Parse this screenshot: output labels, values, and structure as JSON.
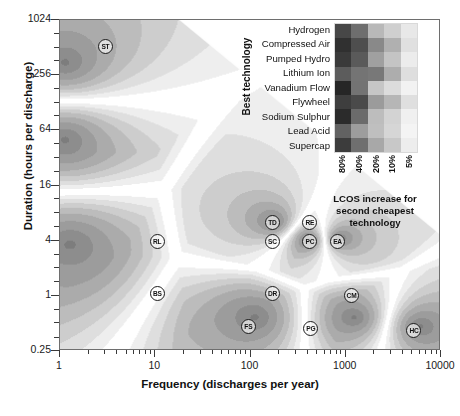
{
  "chart_data": {
    "type": "heatmap",
    "title": "",
    "xlabel": "Frequency (discharges per year)",
    "ylabel": "Duration (hours per discharge)",
    "xscale": "log",
    "yscale": "log",
    "xlim": [
      1,
      10000
    ],
    "ylim": [
      0.25,
      1024
    ],
    "xticks": [
      "1",
      "10",
      "100",
      "1000",
      "10000"
    ],
    "xtick_values": [
      1,
      10,
      100,
      1000,
      10000
    ],
    "yticks": [
      "1024",
      "256",
      "64",
      "16",
      "4",
      "1",
      "0.25"
    ],
    "ytick_values": [
      1024,
      256,
      64,
      16,
      4,
      1,
      0.25
    ],
    "grid": false,
    "legend_position": "inset-top-right",
    "markers": [
      {
        "label": "ST",
        "x": 3.0,
        "y": 520
      },
      {
        "label": "TD",
        "x": 170,
        "y": 6.3
      },
      {
        "label": "RE",
        "x": 420,
        "y": 6.3
      },
      {
        "label": "RL",
        "x": 10.5,
        "y": 3.9
      },
      {
        "label": "SC",
        "x": 170,
        "y": 3.9
      },
      {
        "label": "PC",
        "x": 420,
        "y": 3.9
      },
      {
        "label": "EA",
        "x": 820,
        "y": 3.9
      },
      {
        "label": "BS",
        "x": 10.5,
        "y": 1.05
      },
      {
        "label": "DR",
        "x": 170,
        "y": 1.05
      },
      {
        "label": "CM",
        "x": 1150,
        "y": 1.0
      },
      {
        "label": "FS",
        "x": 95,
        "y": 0.46
      },
      {
        "label": "PG",
        "x": 430,
        "y": 0.44
      },
      {
        "label": "HC",
        "x": 5200,
        "y": 0.42
      }
    ],
    "legend": {
      "row_axis_title": "Best technology",
      "rows": [
        "Hydrogen",
        "Compressed Air",
        "Pumped Hydro",
        "Lithium Ion",
        "Vanadium Flow",
        "Flywheel",
        "Sodium Sulphur",
        "Lead Acid",
        "Supercap"
      ],
      "columns": [
        "80%",
        "40%",
        "20%",
        "10%",
        "5%"
      ],
      "caption": "LCOS increase for second cheapest technology",
      "cell_shades": [
        [
          "#474747",
          "#6e6e6e",
          "#b8b8b8",
          "#cfcfcf",
          "#e8e8e8"
        ],
        [
          "#303030",
          "#4e4e4e",
          "#898989",
          "#b0b0b0",
          "#e0e0e0"
        ],
        [
          "#3a3a3a",
          "#5a5a5a",
          "#a0a0a0",
          "#c4c4c4",
          "#ececec"
        ],
        [
          "#5c5c5c",
          "#747474",
          "#787878",
          "#adadad",
          "#dedede"
        ],
        [
          "#262626",
          "#737373",
          "#c6c6c6",
          "#dcdcdc",
          "#f2f2f2"
        ],
        [
          "#3e3e3e",
          "#4a4a4a",
          "#9b9b9b",
          "#b6b6b6",
          "#dfdfdf"
        ],
        [
          "#2b2b2b",
          "#6b6b6b",
          "#bdbdbd",
          "#d3d3d3",
          "#f0f0f0"
        ],
        [
          "#626262",
          "#9d9d9d",
          "#bfbfbf",
          "#d6d6d6",
          "#f4f4f4"
        ],
        [
          "#3c3c3c",
          "#6f6f6f",
          "#a8a8a8",
          "#c8c8c8",
          "#ededed"
        ]
      ]
    }
  }
}
